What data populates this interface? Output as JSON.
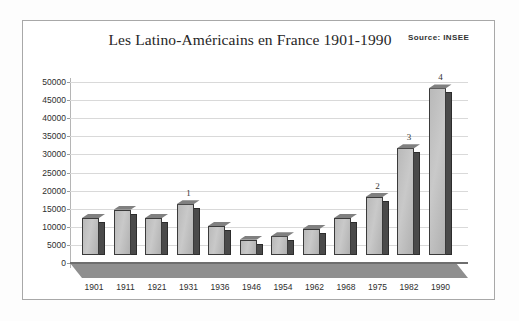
{
  "chart_data": {
    "type": "bar",
    "title": "Les Latino-Américains en France 1901-1990",
    "source_note": "Source: INSEE",
    "xlabel": "",
    "ylabel": "",
    "categories": [
      "1901",
      "1911",
      "1921",
      "1931",
      "1936",
      "1946",
      "1954",
      "1962",
      "1968",
      "1975",
      "1982",
      "1990"
    ],
    "values": [
      10200,
      12500,
      10200,
      14000,
      8000,
      4200,
      5200,
      7200,
      10200,
      16000,
      29500,
      46000
    ],
    "ylim": [
      0,
      50000
    ],
    "ytick_labels": [
      "0",
      "5000",
      "10000",
      "15000",
      "20000",
      "25000",
      "30000",
      "35000",
      "40000",
      "45000",
      "50000"
    ],
    "ytick_values": [
      0,
      5000,
      10000,
      15000,
      20000,
      25000,
      30000,
      35000,
      40000,
      45000,
      50000
    ],
    "grid": true,
    "legend": "none",
    "annotations": [
      {
        "category": "1931",
        "label": "1"
      },
      {
        "category": "1975",
        "label": "2"
      },
      {
        "category": "1982",
        "label": "3"
      },
      {
        "category": "1990",
        "label": "4"
      }
    ],
    "bar_fill_color": "#c2c2c2",
    "bar_edge_color": "#3a3a3a",
    "bar_side_color": "#4a4a4a",
    "grid_color": "#d9d9d9",
    "floor_color": "#8f8f8f",
    "background_color": "#ffffff",
    "frame_color": "#a8a8a8"
  }
}
